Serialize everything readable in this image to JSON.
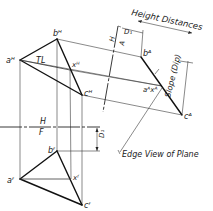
{
  "diagram": {
    "type": "descriptive-geometry-edge-view",
    "colors": {
      "ink": "#111111",
      "construction": "#3a3a3a",
      "background": "#ffffff"
    },
    "labels": {
      "heading": "Height Distances",
      "slope": "Slope (Dip)",
      "edge_view": "Edge View of Plane",
      "true_length": "TL",
      "ref_hf_top": "H",
      "ref_hf_bottom": "F",
      "ref_ha_left": "H",
      "ref_ha_right": "A",
      "d1_top": "D₁",
      "d1_front": "D₁"
    },
    "points": {
      "top_view": {
        "a": {
          "label": "aᴴ",
          "x": 20,
          "y": 60
        },
        "b": {
          "label": "bᴴ",
          "x": 57,
          "y": 39
        },
        "c": {
          "label": "cᴴ",
          "x": 82,
          "y": 95
        },
        "x": {
          "label": "xᴴ",
          "x": 70,
          "y": 70
        }
      },
      "front_view": {
        "a": {
          "label": "aᶠ",
          "x": 20,
          "y": 179
        },
        "b": {
          "label": "bᶠ",
          "x": 57,
          "y": 151
        },
        "c": {
          "label": "cᶠ",
          "x": 82,
          "y": 205
        },
        "x": {
          "label": "xᶠ",
          "x": 71,
          "y": 179
        }
      },
      "auxiliary_view": {
        "b": {
          "label": "bᴬ",
          "x": 141,
          "y": 57
        },
        "ax": {
          "label": "aᴬxᴬ",
          "x": 162,
          "y": 86
        },
        "c": {
          "label": "cᴬ",
          "x": 182,
          "y": 115
        }
      }
    }
  }
}
